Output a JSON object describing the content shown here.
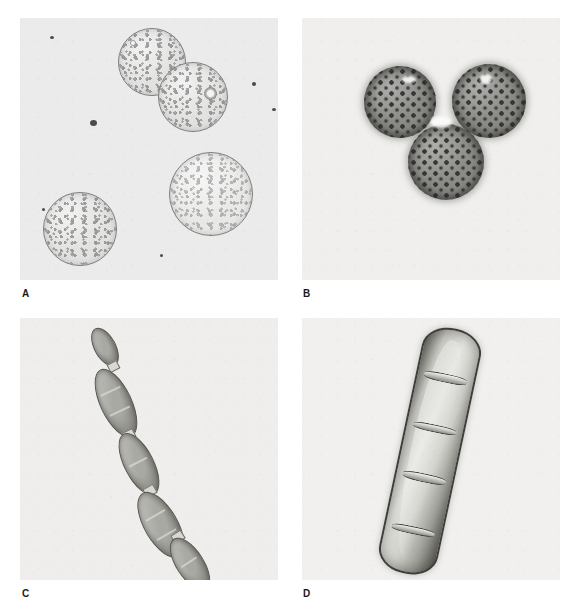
{
  "figure": {
    "type": "micrograph-plate",
    "layout": "2x2",
    "background_color": "#ffffff",
    "panel_count": 4
  },
  "panels": [
    {
      "id": "A",
      "label": "A",
      "position": "top-left",
      "subject": "smooth-walled spherical cells",
      "background_color": "#ebebeb",
      "object_count": 4,
      "objects": [
        {
          "name": "spherical-cell-1",
          "shape": "circle",
          "x": 98,
          "y": 10,
          "d": 66,
          "note": "upper cell, touching cell-2"
        },
        {
          "name": "spherical-cell-2",
          "shape": "circle",
          "x": 138,
          "y": 44,
          "d": 68,
          "note": "middle cell with refractile vacuole"
        },
        {
          "name": "spherical-cell-3",
          "shape": "circle",
          "x": 149,
          "y": 134,
          "d": 82,
          "note": "right lower cell, palest"
        },
        {
          "name": "spherical-cell-4",
          "shape": "circle",
          "x": 23,
          "y": 174,
          "d": 72,
          "note": "lower-left cell"
        }
      ],
      "debris_specks": [
        {
          "x": 70,
          "y": 102,
          "r": 3.2
        },
        {
          "x": 30,
          "y": 18,
          "r": 2.0
        },
        {
          "x": 232,
          "y": 64,
          "r": 2.2
        },
        {
          "x": 252,
          "y": 90,
          "r": 2.0
        },
        {
          "x": 22,
          "y": 190,
          "r": 1.6
        },
        {
          "x": 140,
          "y": 236,
          "r": 1.6
        },
        {
          "x": 152,
          "y": 262,
          "r": 1.4
        }
      ]
    },
    {
      "id": "B",
      "label": "B",
      "position": "top-right",
      "subject": "pitted ornamented spores in triad",
      "background_color": "#f0efee",
      "object_count": 3,
      "objects": [
        {
          "name": "pitted-spore-upper-left",
          "shape": "circle",
          "x": 62,
          "y": 48,
          "d": 72
        },
        {
          "name": "pitted-spore-upper-right",
          "shape": "circle",
          "x": 150,
          "y": 46,
          "d": 74
        },
        {
          "name": "pitted-spore-lower",
          "shape": "circle",
          "x": 106,
          "y": 106,
          "d": 76
        }
      ]
    },
    {
      "id": "C",
      "label": "C",
      "position": "bottom-left",
      "subject": "chain of five spindle-shaped cells",
      "background_color": "#efeeec",
      "object_count": 5,
      "orientation": "diagonal upper-left to lower-right",
      "objects": [
        {
          "name": "chain-cell-1",
          "w": 20,
          "h": 40,
          "x": 74,
          "y": 8,
          "rot": -28
        },
        {
          "name": "chain-cell-2",
          "w": 30,
          "h": 72,
          "x": 80,
          "y": 48,
          "rot": -25
        },
        {
          "name": "chain-cell-3",
          "w": 28,
          "h": 66,
          "x": 104,
          "y": 112,
          "rot": -27
        },
        {
          "name": "chain-cell-4",
          "w": 32,
          "h": 72,
          "x": 124,
          "y": 170,
          "rot": -30
        },
        {
          "name": "chain-cell-5",
          "w": 26,
          "h": 58,
          "x": 156,
          "y": 216,
          "rot": -33
        }
      ]
    },
    {
      "id": "D",
      "label": "D",
      "position": "bottom-right",
      "subject": "large multiseptate macroconidium",
      "background_color": "#f1f0ef",
      "object_count": 1,
      "septa_count": 4,
      "tilt_degrees": 12,
      "objects": [
        {
          "name": "macroconidium",
          "w": 56,
          "h": 246,
          "x": 98,
          "y": 8,
          "rot": 12
        }
      ]
    }
  ],
  "labels": {
    "a": "A",
    "b": "B",
    "c": "C",
    "d": "D"
  }
}
